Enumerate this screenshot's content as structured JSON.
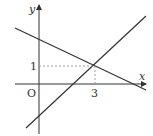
{
  "diagram": {
    "axis_x_label": "x",
    "axis_y_label": "y",
    "origin_label": "O",
    "tick_x": "3",
    "tick_y": "1",
    "intersection": {
      "x": 3,
      "y": 1
    },
    "colors": {
      "line": "#333333",
      "dashed": "#888888"
    }
  }
}
